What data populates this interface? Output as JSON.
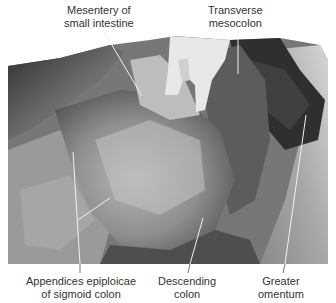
{
  "figure": {
    "type": "anatomical dissection photograph (grayscale)",
    "labels": {
      "mesentery": {
        "line1": "Mesentery of",
        "line2": "small intestine"
      },
      "transverse_mesocolon": {
        "line1": "Transverse",
        "line2": "mesocolon"
      },
      "appendices": {
        "line1": "Appendices epiploicae",
        "line2": "of sigmoid colon"
      },
      "descending_colon": {
        "line1": "Descending",
        "line2": "colon"
      },
      "greater_omentum": {
        "line1": "Greater",
        "line2": "omentum"
      }
    }
  }
}
